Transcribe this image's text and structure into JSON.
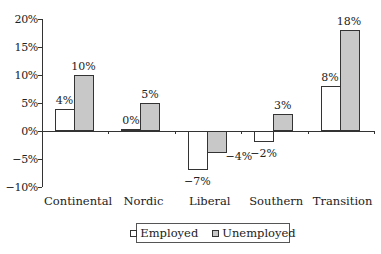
{
  "chart_data": {
    "type": "bar",
    "title": "",
    "xlabel": "",
    "ylabel": "",
    "categories": [
      "Continental",
      "Nordic",
      "Liberal",
      "Southern",
      "Transition"
    ],
    "series": [
      {
        "name": "Employed",
        "values": [
          4,
          0,
          -7,
          -2,
          8
        ],
        "labels": [
          "4%",
          "0%",
          "-7%",
          "-2%",
          "8%"
        ],
        "color": "#ffffff"
      },
      {
        "name": "Unemployed",
        "values": [
          10,
          5,
          -4,
          3,
          18
        ],
        "labels": [
          "10%",
          "5%",
          "-4%",
          "3%",
          "18%"
        ],
        "color": "#c8c8c8"
      }
    ],
    "ylim": [
      -10,
      20
    ],
    "yticks": [
      20,
      15,
      10,
      5,
      0,
      -5,
      -10
    ],
    "ytick_labels": [
      "20%",
      "15%",
      "10%",
      "5%",
      "0%",
      "-5%",
      "-10%"
    ],
    "grid": false,
    "legend_position": "bottom-center"
  },
  "legend": {
    "employed": "Employed",
    "unemployed": "Unemployed"
  }
}
